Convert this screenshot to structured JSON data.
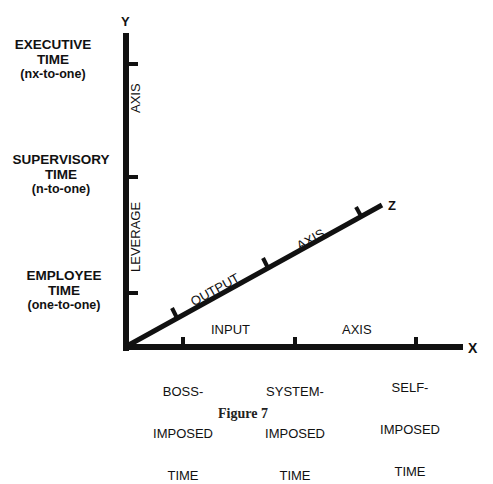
{
  "figure": {
    "caption": "Figure 7",
    "axes": {
      "y": {
        "letter": "Y",
        "title": "LEVERAGE AXIS",
        "title_parts": [
          "LEVERAGE",
          "AXIS"
        ]
      },
      "x": {
        "letter": "X",
        "title": "INPUT AXIS",
        "title_parts": [
          "INPUT",
          "AXIS"
        ]
      },
      "z": {
        "letter": "Z",
        "title": "OUTPUT AXIS",
        "title_parts": [
          "OUTPUT",
          "AXIS"
        ]
      }
    },
    "y_levels": [
      {
        "line1": "EXECUTIVE",
        "line2": "TIME",
        "line3": "(nx-to-one)"
      },
      {
        "line1": "SUPERVISORY",
        "line2": "TIME",
        "line3": "(n-to-one)"
      },
      {
        "line1": "EMPLOYEE",
        "line2": "TIME",
        "line3": "(one-to-one)"
      }
    ],
    "x_levels": [
      {
        "line1": "BOSS-",
        "line2": "IMPOSED",
        "line3": "TIME"
      },
      {
        "line1": "SYSTEM-",
        "line2": "IMPOSED",
        "line3": "TIME"
      },
      {
        "line1": "SELF-",
        "line2": "IMPOSED",
        "line3": "TIME"
      }
    ],
    "colors": {
      "ink": "#111111",
      "background": "#ffffff"
    }
  }
}
